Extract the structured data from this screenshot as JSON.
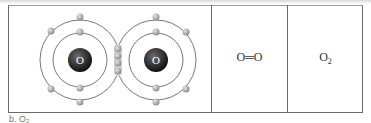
{
  "diagram": {
    "cells": [
      {
        "type": "electron-shell-model",
        "atoms": [
          {
            "symbol": "O",
            "center": [
              80,
              60
            ],
            "inner_radius": 28,
            "outer_radius": 40
          },
          {
            "symbol": "O",
            "center": [
              156,
              60
            ],
            "inner_radius": 28,
            "outer_radius": 40
          }
        ],
        "shared_electrons": 4
      },
      {
        "type": "structural-formula",
        "label": "O═O"
      },
      {
        "type": "molecular-formula",
        "label": "O",
        "subscript": "2"
      }
    ],
    "caption": "b. O₂"
  },
  "colors": {
    "nucleus": "#1e1e1e",
    "electron": "#a9a9a9",
    "orbit": "#555555",
    "border": "#6a6a6a"
  }
}
